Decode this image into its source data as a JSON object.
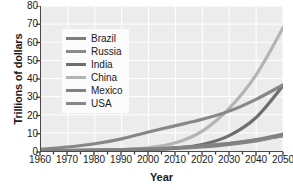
{
  "chart_data": {
    "type": "line",
    "title": "",
    "xlabel": "Year",
    "ylabel": "Trillions of dollars",
    "xlim": [
      1960,
      2050
    ],
    "ylim": [
      0,
      80
    ],
    "xticks": [
      1960,
      1970,
      1980,
      1990,
      2000,
      2010,
      2020,
      2030,
      2040,
      2050
    ],
    "yticks": [
      0,
      10,
      20,
      30,
      40,
      50,
      60,
      70,
      80
    ],
    "grid": true,
    "legend_position": "upper-left",
    "x": [
      1960,
      1970,
      1980,
      1990,
      2000,
      2010,
      2020,
      2030,
      2040,
      2050
    ],
    "series": [
      {
        "name": "Brazil",
        "color": "#7d7d7d",
        "values": [
          0.1,
          0.2,
          0.4,
          0.6,
          0.9,
          1.4,
          2.2,
          3.6,
          5.6,
          8.4
        ]
      },
      {
        "name": "Russia",
        "color": "#8a8a8a",
        "values": [
          0.1,
          0.2,
          0.3,
          0.5,
          0.8,
          1.5,
          2.6,
          4.0,
          6.0,
          8.6
        ]
      },
      {
        "name": "India",
        "color": "#6e6e6e",
        "values": [
          0.1,
          0.2,
          0.3,
          0.5,
          0.9,
          1.7,
          3.6,
          8.5,
          18.5,
          36.0
        ]
      },
      {
        "name": "China",
        "color": "#b4b4b4",
        "values": [
          0.1,
          0.2,
          0.4,
          0.8,
          1.7,
          4.5,
          11.0,
          23.5,
          42.0,
          68.0
        ]
      },
      {
        "name": "Mexico",
        "color": "#828282",
        "values": [
          0.2,
          0.3,
          0.5,
          0.8,
          1.2,
          1.8,
          2.8,
          4.2,
          6.3,
          9.3
        ]
      },
      {
        "name": "USA",
        "color": "#878787",
        "values": [
          1.0,
          2.2,
          4.0,
          6.7,
          10.5,
          14.0,
          17.5,
          22.0,
          28.5,
          36.5
        ]
      }
    ],
    "annotations": []
  }
}
